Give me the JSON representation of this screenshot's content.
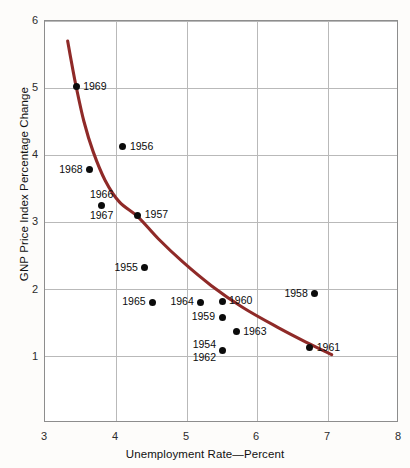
{
  "chart_data": {
    "type": "scatter",
    "title": "",
    "xlabel": "Unemployment Rate—Percent",
    "ylabel": "GNP Price Index Percentage Change",
    "xlim": [
      3,
      8
    ],
    "ylim": [
      0,
      6
    ],
    "xticks": [
      "3",
      "4",
      "5",
      "6",
      "7",
      "8"
    ],
    "yticks": [
      "1",
      "2",
      "3",
      "4",
      "5",
      "6"
    ],
    "grid": true,
    "legend": "none",
    "curve_color": "#8f2a28",
    "point_color": "#0b0b0b",
    "points": [
      {
        "label": "1969",
        "x": 3.44,
        "y": 5.02,
        "label_pos": "right"
      },
      {
        "label": "1956",
        "x": 4.1,
        "y": 4.12,
        "label_pos": "right"
      },
      {
        "label": "1968",
        "x": 3.63,
        "y": 3.78,
        "label_pos": "left"
      },
      {
        "label": "1966",
        "x": 3.8,
        "y": 3.25,
        "label_pos": "above"
      },
      {
        "label": "1967",
        "x": 3.8,
        "y": 3.25,
        "label_pos": "below"
      },
      {
        "label": "1957",
        "x": 4.31,
        "y": 3.1,
        "label_pos": "right"
      },
      {
        "label": "1955",
        "x": 4.41,
        "y": 2.32,
        "label_pos": "left"
      },
      {
        "label": "1965",
        "x": 4.52,
        "y": 1.8,
        "label_pos": "left"
      },
      {
        "label": "1964",
        "x": 5.2,
        "y": 1.8,
        "label_pos": "left"
      },
      {
        "label": "1960",
        "x": 5.5,
        "y": 1.82,
        "label_pos": "right"
      },
      {
        "label": "1959",
        "x": 5.5,
        "y": 1.58,
        "label_pos": "left"
      },
      {
        "label": "1963",
        "x": 5.7,
        "y": 1.36,
        "label_pos": "right"
      },
      {
        "label": "1954",
        "x": 5.5,
        "y": 1.08,
        "label_pos": "above-left"
      },
      {
        "label": "1962",
        "x": 5.5,
        "y": 1.08,
        "label_pos": "below-left"
      },
      {
        "label": "1958",
        "x": 6.81,
        "y": 1.93,
        "label_pos": "left"
      },
      {
        "label": "1961",
        "x": 6.74,
        "y": 1.12,
        "label_pos": "right"
      }
    ],
    "fitted_curve": {
      "name": "Phillips curve",
      "points": [
        {
          "x": 3.32,
          "y": 5.7
        },
        {
          "x": 3.38,
          "y": 5.35
        },
        {
          "x": 3.44,
          "y": 5.02
        },
        {
          "x": 3.55,
          "y": 4.5
        },
        {
          "x": 3.68,
          "y": 4.05
        },
        {
          "x": 3.85,
          "y": 3.62
        },
        {
          "x": 4.05,
          "y": 3.3
        },
        {
          "x": 4.31,
          "y": 3.08
        },
        {
          "x": 4.6,
          "y": 2.75
        },
        {
          "x": 4.95,
          "y": 2.4
        },
        {
          "x": 5.35,
          "y": 2.05
        },
        {
          "x": 5.8,
          "y": 1.72
        },
        {
          "x": 6.3,
          "y": 1.42
        },
        {
          "x": 6.7,
          "y": 1.2
        },
        {
          "x": 7.05,
          "y": 1.02
        }
      ]
    }
  }
}
